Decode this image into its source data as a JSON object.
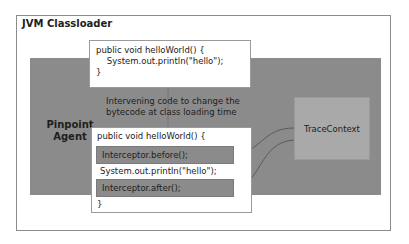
{
  "title": "JVM Classloader",
  "agent": {
    "label_line1": "Pinpoint",
    "label_line2": "Agent"
  },
  "original_code": {
    "line1": "public void helloWorld() {",
    "line2": "    System.out.println(\"hello\");",
    "line3": "}"
  },
  "intervening_text": {
    "line1": "Intervening code to change the",
    "line2": "bytecode at class loading time"
  },
  "modified_code": {
    "line1": "public void helloWorld() {",
    "before": "Interceptor.before();",
    "middle": "System.out.println(\"hello\");",
    "after": "Interceptor.after();",
    "close": "}"
  },
  "trace_context": "TraceContext"
}
